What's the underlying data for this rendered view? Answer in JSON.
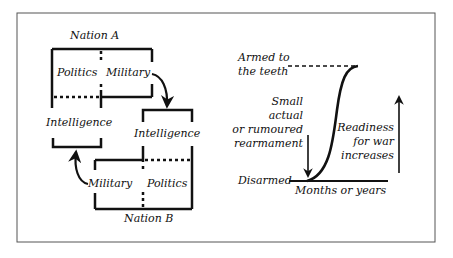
{
  "colors": {
    "ink": "#111111",
    "frame": "#555555",
    "background": "#ffffff"
  },
  "left_diagram": {
    "nation_a": {
      "title": "Nation A",
      "politics": "Politics",
      "military": "Military",
      "intelligence": "Intelligence"
    },
    "nation_b": {
      "title": "Nation B",
      "politics": "Politics",
      "military": "Military",
      "intelligence": "Intelligence"
    }
  },
  "right_diagram": {
    "top_label_line1": "Armed to",
    "top_label_line2": "the teeth",
    "trigger_line1": "Small",
    "trigger_line2": "actual",
    "trigger_line3": "or rumoured",
    "trigger_line4": "rearmament",
    "readiness_line1": "Readiness",
    "readiness_line2": "for war",
    "readiness_line3": "increases",
    "bottom_label": "Disarmed",
    "x_axis_label": "Months or years"
  }
}
